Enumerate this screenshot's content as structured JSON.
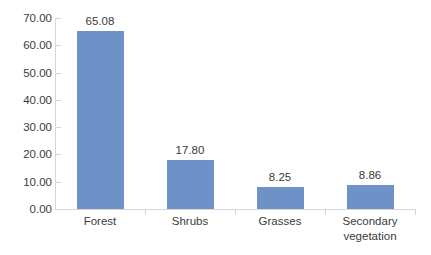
{
  "chart_data": {
    "type": "bar",
    "title": "",
    "subtitle": "",
    "xlabel": "",
    "ylabel": "",
    "categories": [
      "Forest",
      "Shrubs",
      "Grasses",
      "Secondary vegetation"
    ],
    "category_lines": [
      [
        "Forest"
      ],
      [
        "Shrubs"
      ],
      [
        "Grasses"
      ],
      [
        "Secondary",
        "vegetation"
      ]
    ],
    "values": [
      65.08,
      17.8,
      8.25,
      8.86
    ],
    "value_labels": [
      "65.08",
      "17.80",
      "8.25",
      "8.86"
    ],
    "ylim": [
      0,
      70
    ],
    "ytick_step": 10,
    "ytick_labels": [
      "70.00",
      "60.00",
      "50.00",
      "40.00",
      "30.00",
      "20.00",
      "10.00",
      "0.00"
    ],
    "ytick_values": [
      70,
      60,
      50,
      40,
      30,
      20,
      10,
      0
    ],
    "grid": false,
    "legend": false,
    "legend_position": "none",
    "bar_color": "#6E92C8",
    "axis_color": "#D6D6D6",
    "text_color": "#3B3B3B",
    "background": "#FFFFFF"
  }
}
